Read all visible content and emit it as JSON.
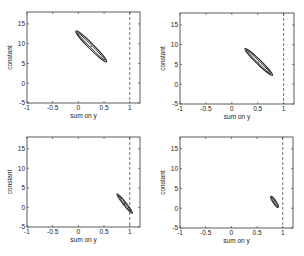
{
  "chart_data": [
    {
      "type": "scatter",
      "title": "",
      "xlabel": "sum on y",
      "ylabel": "constant",
      "xlim": [
        -1,
        1.2
      ],
      "ylim": [
        -5,
        18
      ],
      "xticks": [
        -1,
        -0.5,
        0,
        0.5,
        1
      ],
      "xtick_labels": [
        "-1",
        "-0.5",
        "0",
        "0.5",
        "1"
      ],
      "yticks": [
        -5,
        0,
        5,
        10,
        15
      ],
      "ytick_labels": [
        "-5",
        "0",
        "5",
        "10",
        "15"
      ],
      "reference_line": {
        "x": 1,
        "style": "dashed"
      },
      "ellipse": {
        "center": [
          0.25,
          9.3
        ],
        "x_extent": [
          -0.05,
          0.55
        ],
        "y_extent": [
          5.2,
          13.0
        ],
        "center_marker": true
      },
      "grid": false
    },
    {
      "type": "scatter",
      "title": "",
      "xlabel": "sum on y",
      "ylabel": "constant",
      "xlim": [
        -1,
        1.2
      ],
      "ylim": [
        -5,
        18
      ],
      "xticks": [
        -1,
        -0.5,
        0,
        0.5,
        1
      ],
      "xtick_labels": [
        "-1",
        "-0.5",
        "0",
        "0.5",
        "1"
      ],
      "yticks": [
        -5,
        0,
        5,
        10,
        15
      ],
      "ytick_labels": [
        "-5",
        "0",
        "5",
        "10",
        "15"
      ],
      "reference_line": {
        "x": 1,
        "style": "dashed"
      },
      "ellipse": {
        "center": [
          0.52,
          5.6
        ],
        "x_extent": [
          0.25,
          0.78
        ],
        "y_extent": [
          2.2,
          9.0
        ],
        "center_marker": true
      },
      "grid": false
    },
    {
      "type": "scatter",
      "title": "",
      "xlabel": "sum on y",
      "ylabel": "constant",
      "xlim": [
        -1,
        1.2
      ],
      "ylim": [
        -5,
        18
      ],
      "xticks": [
        -1,
        -0.5,
        0,
        0.5,
        1
      ],
      "xtick_labels": [
        "-1",
        "-0.5",
        "0",
        "0.5",
        "1"
      ],
      "yticks": [
        -5,
        0,
        5,
        10,
        15
      ],
      "ytick_labels": [
        "-5",
        "0",
        "5",
        "10",
        "15"
      ],
      "reference_line": {
        "x": 1,
        "style": "dashed"
      },
      "ellipse": {
        "center": [
          0.9,
          1.0
        ],
        "x_extent": [
          0.75,
          1.05
        ],
        "y_extent": [
          -1.5,
          3.5
        ],
        "center_marker": true
      },
      "grid": false
    },
    {
      "type": "scatter",
      "title": "",
      "xlabel": "sum on y",
      "ylabel": "constant",
      "xlim": [
        -1,
        1.2
      ],
      "ylim": [
        -5,
        18
      ],
      "xticks": [
        -1,
        -0.5,
        0,
        0.5,
        1
      ],
      "xtick_labels": [
        "-1",
        "-0.5",
        "0",
        "0.5",
        "1"
      ],
      "yticks": [
        -5,
        0,
        5,
        10,
        15
      ],
      "ytick_labels": [
        "-5",
        "0",
        "5",
        "10",
        "15"
      ],
      "reference_line": {
        "x": 1,
        "style": "dashed"
      },
      "ellipse": {
        "center": [
          0.84,
          1.6
        ],
        "x_extent": [
          0.78,
          0.92
        ],
        "y_extent": [
          0.2,
          3.0
        ],
        "center_marker": false
      },
      "grid": false
    }
  ],
  "panels": [
    {
      "x0": 27,
      "y0": 12,
      "x1": 140,
      "y1": 103
    },
    {
      "x0": 180,
      "y0": 13,
      "x1": 294,
      "y1": 104
    },
    {
      "x0": 27,
      "y0": 137,
      "x1": 140,
      "y1": 227
    },
    {
      "x0": 180,
      "y0": 137,
      "x1": 293,
      "y1": 228
    }
  ]
}
